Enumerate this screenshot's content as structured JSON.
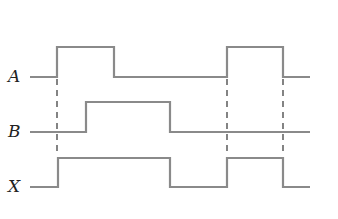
{
  "diagram": {
    "type": "timing-diagram",
    "signals": [
      {
        "name": "A",
        "label_pos": [
          14,
          76
        ],
        "path": "M30,77 L57,77 L57,47 L114,47 L114,77 L227,77 L227,47 L283,47 L283,77 L310,77"
      },
      {
        "name": "B",
        "label_pos": [
          12,
          131
        ],
        "path": "M30,132 L86,132 L86,102 L170,102 L170,132 L310,132"
      },
      {
        "name": "X",
        "label_pos": [
          12,
          186
        ],
        "path": "M30,187 L58,187 L58,158 L170,158 L170,187 L227,187 L227,158 L283,158 L283,187 L310,187"
      }
    ],
    "dashed_guides": [
      {
        "x": 57,
        "y1": 79,
        "y2": 156
      },
      {
        "x": 227,
        "y1": 79,
        "y2": 156
      },
      {
        "x": 283,
        "y1": 79,
        "y2": 156
      }
    ],
    "colors": {
      "waveform": "#8a8a8a",
      "guides": "#333333",
      "labels": "#222222",
      "background": "#ffffff"
    }
  }
}
